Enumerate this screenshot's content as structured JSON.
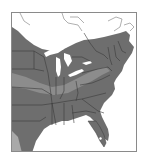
{
  "map": {
    "type": "species-range-map",
    "region": "Eastern United States and southeastern Canada",
    "colors": {
      "range_primary": "#6e6e6e",
      "range_secondary": "#8c8c8c",
      "range_light": "#a9a9a9",
      "outside_range": "#ffffff",
      "water": "#ffffff",
      "borders": "#3a3a3a",
      "frame": "#8a8a8a"
    },
    "legend": [],
    "labels": []
  }
}
